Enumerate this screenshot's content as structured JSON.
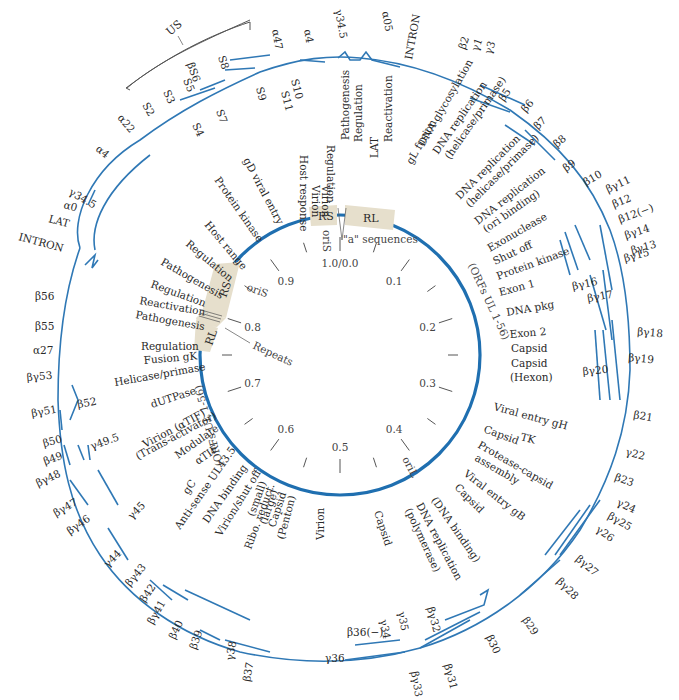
{
  "diagram": {
    "colors": {
      "gene_arrow": "#2f78b5",
      "inner_circle": "#1f6fb0",
      "repeat_box": "#e6dfcc",
      "text": "#2a2a2a",
      "leader": "#555555"
    },
    "center": {
      "x": 340,
      "y": 355
    },
    "inner_radius": 140,
    "regions": {
      "us_bracket_label": "US",
      "rs_top": "RS",
      "rl_top": "RL",
      "rs_left": "RS",
      "rl_left": "RL",
      "a_sequences": "\"a\" sequences",
      "repeats": "Repeats",
      "oris_top": "oriS",
      "oris_left": "oriS",
      "oril": "oriL",
      "orfs_right": "(ORFs UL 1-56)",
      "orfs_left": "(ORFs UL 1-56)"
    },
    "map_units": [
      {
        "label": "1.0/0.0",
        "angle": 0
      },
      {
        "label": "0.1",
        "angle": 36
      },
      {
        "label": "0.2",
        "angle": 72
      },
      {
        "label": "0.3",
        "angle": 108
      },
      {
        "label": "0.4",
        "angle": 144
      },
      {
        "label": "0.5",
        "angle": 180
      },
      {
        "label": "0.6",
        "angle": 216
      },
      {
        "label": "0.7",
        "angle": 252
      },
      {
        "label": "0.8",
        "angle": 288
      },
      {
        "label": "0.9",
        "angle": 324
      }
    ],
    "functions": [
      {
        "text": "Host response",
        "x": 300,
        "y": 155,
        "rot": 90
      },
      {
        "text": "Virion",
        "x": 312,
        "y": 185,
        "rot": 90
      },
      {
        "text": "Virion",
        "x": 322,
        "y": 185,
        "rot": 90
      },
      {
        "text": "Regulation",
        "x": 327,
        "y": 145,
        "rot": 90
      },
      {
        "text": "Pathogenesis",
        "x": 349,
        "y": 140,
        "rot": -90
      },
      {
        "text": "Regulation",
        "x": 362,
        "y": 142,
        "rot": -90
      },
      {
        "text": "LAT",
        "x": 378,
        "y": 158,
        "rot": -90
      },
      {
        "text": "Reactivation",
        "x": 392,
        "y": 142,
        "rot": -90
      },
      {
        "text": "gL fusion",
        "x": 412,
        "y": 165,
        "rot": -60
      },
      {
        "text": "DNA glycosylation",
        "x": 424,
        "y": 147,
        "rot": -60
      },
      {
        "text": "DNA replication",
        "x": 438,
        "y": 155,
        "rot": -55
      },
      {
        "text": "(helicase/primase)",
        "x": 450,
        "y": 160,
        "rot": -55
      },
      {
        "text": "DNA replication",
        "x": 460,
        "y": 200,
        "rot": -45
      },
      {
        "text": "(helicase/primase)",
        "x": 470,
        "y": 208,
        "rot": -45
      },
      {
        "text": "DNA replication",
        "x": 478,
        "y": 225,
        "rot": -38
      },
      {
        "text": "(ori binding)",
        "x": 486,
        "y": 233,
        "rot": -35
      },
      {
        "text": "Exonuclease",
        "x": 490,
        "y": 252,
        "rot": -30
      },
      {
        "text": "Shut off",
        "x": 495,
        "y": 265,
        "rot": -25
      },
      {
        "text": "Protein kinase",
        "x": 498,
        "y": 280,
        "rot": -20
      },
      {
        "text": "Exon 1",
        "x": 500,
        "y": 296,
        "rot": -15
      },
      {
        "text": "DNA pkg",
        "x": 507,
        "y": 316,
        "rot": -10
      },
      {
        "text": "Exon 2",
        "x": 510,
        "y": 338,
        "rot": -5
      },
      {
        "text": "Capsid",
        "x": 511,
        "y": 352,
        "rot": 0
      },
      {
        "text": "Capsid",
        "x": 511,
        "y": 367,
        "rot": 0
      },
      {
        "text": "(Hexon)",
        "x": 510,
        "y": 381,
        "rot": 0
      },
      {
        "text": "Viral entry gH",
        "x": 493,
        "y": 410,
        "rot": 15
      },
      {
        "text": "TK",
        "x": 520,
        "y": 440,
        "rot": 15
      },
      {
        "text": "Capsid",
        "x": 483,
        "y": 432,
        "rot": 20
      },
      {
        "text": "Protease-capsid",
        "x": 477,
        "y": 447,
        "rot": 30
      },
      {
        "text": "assembly",
        "x": 474,
        "y": 460,
        "rot": 30
      },
      {
        "text": "Viral entry gB",
        "x": 463,
        "y": 475,
        "rot": 38
      },
      {
        "text": "Capsid",
        "x": 454,
        "y": 488,
        "rot": 45
      },
      {
        "text": "(DNA binding)",
        "x": 431,
        "y": 500,
        "rot": 55
      },
      {
        "text": "DNA replication",
        "x": 416,
        "y": 505,
        "rot": 62
      },
      {
        "text": "(polymerase)",
        "x": 405,
        "y": 510,
        "rot": 65
      },
      {
        "text": "Capsid",
        "x": 374,
        "y": 512,
        "rot": 72
      },
      {
        "text": "Virion",
        "x": 324,
        "y": 540,
        "rot": -90
      },
      {
        "text": "(small)",
        "x": 254,
        "y": 517,
        "rot": -70
      },
      {
        "text": "Ribo. reduct.",
        "x": 251,
        "y": 550,
        "rot": -70
      },
      {
        "text": "(large)",
        "x": 266,
        "y": 525,
        "rot": -70
      },
      {
        "text": "Capsid",
        "x": 275,
        "y": 528,
        "rot": -72
      },
      {
        "text": "(Penton)",
        "x": 284,
        "y": 540,
        "rot": -75
      },
      {
        "text": "gC",
        "x": 188,
        "y": 495,
        "rot": -55
      },
      {
        "text": "Anti-sense UL43.5",
        "x": 180,
        "y": 530,
        "rot": -55
      },
      {
        "text": "DNA binding",
        "x": 208,
        "y": 524,
        "rot": -55
      },
      {
        "text": "Virion/shut off",
        "x": 221,
        "y": 537,
        "rot": -58
      },
      {
        "text": "Modulate",
        "x": 178,
        "y": 459,
        "rot": -35
      },
      {
        "text": "αTIF",
        "x": 198,
        "y": 465,
        "rot": -35
      },
      {
        "text": "Virion (αTIF)",
        "x": 145,
        "y": 448,
        "rot": -28
      },
      {
        "text": "(Trans-activator)",
        "x": 138,
        "y": 460,
        "rot": -28
      },
      {
        "text": "dUTPase",
        "x": 152,
        "y": 408,
        "rot": -18
      },
      {
        "text": "Helicase/primase",
        "x": 115,
        "y": 386,
        "rot": -10
      },
      {
        "text": "Fusion gK",
        "x": 144,
        "y": 364,
        "rot": -5
      },
      {
        "text": "Regulation",
        "x": 141,
        "y": 350,
        "rot": 0
      },
      {
        "text": "Pathogenesis",
        "x": 135,
        "y": 318,
        "rot": 10
      },
      {
        "text": "Reactivation",
        "x": 139,
        "y": 304,
        "rot": 10
      },
      {
        "text": "Regulation",
        "x": 150,
        "y": 287,
        "rot": 20
      },
      {
        "text": "Pathogenesis",
        "x": 160,
        "y": 264,
        "rot": 30
      },
      {
        "text": "Regulation",
        "x": 185,
        "y": 245,
        "rot": 40
      },
      {
        "text": "Host range",
        "x": 204,
        "y": 225,
        "rot": 50
      },
      {
        "text": "Protein kinase",
        "x": 214,
        "y": 180,
        "rot": 55
      },
      {
        "text": "gD viral entry",
        "x": 243,
        "y": 160,
        "rot": 62
      }
    ],
    "genes": [
      {
        "text": "α47",
        "x": 272,
        "y": 30,
        "rot": 80
      },
      {
        "text": "α4",
        "x": 304,
        "y": 30,
        "rot": 80
      },
      {
        "text": "γ34.5",
        "x": 335,
        "y": 10,
        "rot": 80
      },
      {
        "text": "α05",
        "x": 382,
        "y": 12,
        "rot": 80
      },
      {
        "text": "INTRON",
        "x": 412,
        "y": 60,
        "rot": -80
      },
      {
        "text": "β2",
        "x": 465,
        "y": 50,
        "rot": -70
      },
      {
        "text": "γ1",
        "x": 478,
        "y": 52,
        "rot": -70
      },
      {
        "text": "γ3",
        "x": 491,
        "y": 55,
        "rot": -70
      },
      {
        "text": "β5",
        "x": 504,
        "y": 102,
        "rot": -55
      },
      {
        "text": "β6",
        "x": 526,
        "y": 113,
        "rot": -50
      },
      {
        "text": "β7",
        "x": 538,
        "y": 130,
        "rot": -45
      },
      {
        "text": "β8",
        "x": 557,
        "y": 148,
        "rot": -40
      },
      {
        "text": "β9",
        "x": 566,
        "y": 172,
        "rot": -35
      },
      {
        "text": "β10",
        "x": 586,
        "y": 186,
        "rot": -30
      },
      {
        "text": "βγ11",
        "x": 608,
        "y": 193,
        "rot": -25
      },
      {
        "text": "β12",
        "x": 614,
        "y": 208,
        "rot": -22
      },
      {
        "text": "β12(−)",
        "x": 620,
        "y": 223,
        "rot": -20
      },
      {
        "text": "βγ14",
        "x": 626,
        "y": 239,
        "rot": -18
      },
      {
        "text": "βγ13",
        "x": 632,
        "y": 254,
        "rot": -15
      },
      {
        "text": "βγ15",
        "x": 625,
        "y": 262,
        "rot": -15
      },
      {
        "text": "βγ16",
        "x": 573,
        "y": 290,
        "rot": -12
      },
      {
        "text": "βγ17",
        "x": 588,
        "y": 302,
        "rot": -10
      },
      {
        "text": "βγ18",
        "x": 637,
        "y": 335,
        "rot": 5
      },
      {
        "text": "βγ19",
        "x": 628,
        "y": 361,
        "rot": 5
      },
      {
        "text": "βγ20",
        "x": 583,
        "y": 375,
        "rot": -5
      },
      {
        "text": "β21",
        "x": 633,
        "y": 418,
        "rot": 10
      },
      {
        "text": "γ22",
        "x": 625,
        "y": 455,
        "rot": 15
      },
      {
        "text": "β23",
        "x": 614,
        "y": 480,
        "rot": 20
      },
      {
        "text": "γ24",
        "x": 616,
        "y": 505,
        "rot": 25
      },
      {
        "text": "βγ25",
        "x": 607,
        "y": 518,
        "rot": 30
      },
      {
        "text": "γ26",
        "x": 595,
        "y": 531,
        "rot": 35
      },
      {
        "text": "βγ27",
        "x": 575,
        "y": 560,
        "rot": 40
      },
      {
        "text": "βγ28",
        "x": 556,
        "y": 582,
        "rot": 45
      },
      {
        "text": "β29",
        "x": 522,
        "y": 620,
        "rot": 55
      },
      {
        "text": "β30",
        "x": 486,
        "y": 637,
        "rot": 65
      },
      {
        "text": "βγ31",
        "x": 444,
        "y": 665,
        "rot": 75
      },
      {
        "text": "βγ32",
        "x": 427,
        "y": 608,
        "rot": 75
      },
      {
        "text": "βγ33",
        "x": 411,
        "y": 672,
        "rot": 80
      },
      {
        "text": "γ35",
        "x": 398,
        "y": 612,
        "rot": 80
      },
      {
        "text": "γ34",
        "x": 380,
        "y": 620,
        "rot": 80
      },
      {
        "text": "β36(−)",
        "x": 347,
        "y": 636,
        "rot": 0
      },
      {
        "text": "γ36",
        "x": 325,
        "y": 662,
        "rot": 0
      },
      {
        "text": "β37",
        "x": 250,
        "y": 682,
        "rot": -80
      },
      {
        "text": "γ38",
        "x": 233,
        "y": 661,
        "rot": -80
      },
      {
        "text": "β39",
        "x": 196,
        "y": 650,
        "rot": -70
      },
      {
        "text": "β40",
        "x": 175,
        "y": 640,
        "rot": -65
      },
      {
        "text": "βγ41",
        "x": 153,
        "y": 625,
        "rot": -60
      },
      {
        "text": "β42",
        "x": 145,
        "y": 603,
        "rot": -55
      },
      {
        "text": "βγ43",
        "x": 130,
        "y": 587,
        "rot": -50
      },
      {
        "text": "γ44",
        "x": 108,
        "y": 568,
        "rot": -45
      },
      {
        "text": "γ45",
        "x": 132,
        "y": 520,
        "rot": -45
      },
      {
        "text": "βγ46",
        "x": 70,
        "y": 535,
        "rot": -35
      },
      {
        "text": "βγ47",
        "x": 56,
        "y": 517,
        "rot": -30
      },
      {
        "text": "βγ48",
        "x": 38,
        "y": 487,
        "rot": -25
      },
      {
        "text": "β49",
        "x": 45,
        "y": 465,
        "rot": -20
      },
      {
        "text": "γ49.5",
        "x": 92,
        "y": 450,
        "rot": -20
      },
      {
        "text": "β50",
        "x": 44,
        "y": 447,
        "rot": -15
      },
      {
        "text": "βγ51",
        "x": 32,
        "y": 417,
        "rot": -10
      },
      {
        "text": "β52",
        "x": 78,
        "y": 408,
        "rot": -10
      },
      {
        "text": "βγ53",
        "x": 27,
        "y": 381,
        "rot": -5
      },
      {
        "text": "α27",
        "x": 33,
        "y": 354,
        "rot": 0
      },
      {
        "text": "β55",
        "x": 35,
        "y": 330,
        "rot": 0
      },
      {
        "text": "β56",
        "x": 35,
        "y": 300,
        "rot": 0
      },
      {
        "text": "INTRON",
        "x": 18,
        "y": 240,
        "rot": 15
      },
      {
        "text": "LAT",
        "x": 48,
        "y": 222,
        "rot": 15
      },
      {
        "text": "α0",
        "x": 63,
        "y": 208,
        "rot": 15
      },
      {
        "text": "γ34.5",
        "x": 68,
        "y": 194,
        "rot": 30
      },
      {
        "text": "α4",
        "x": 95,
        "y": 150,
        "rot": 40
      },
      {
        "text": "α22",
        "x": 117,
        "y": 118,
        "rot": 50
      },
      {
        "text": "S2",
        "x": 142,
        "y": 105,
        "rot": 60
      },
      {
        "text": "S3",
        "x": 163,
        "y": 92,
        "rot": 65
      },
      {
        "text": "S4",
        "x": 192,
        "y": 125,
        "rot": 65
      },
      {
        "text": "S5",
        "x": 183,
        "y": 80,
        "rot": 68
      },
      {
        "text": "βS6",
        "x": 187,
        "y": 64,
        "rot": 70
      },
      {
        "text": "S7",
        "x": 216,
        "y": 111,
        "rot": 70
      },
      {
        "text": "S8",
        "x": 218,
        "y": 57,
        "rot": 72
      },
      {
        "text": "S9",
        "x": 256,
        "y": 88,
        "rot": 75
      },
      {
        "text": "S10",
        "x": 291,
        "y": 80,
        "rot": 75
      },
      {
        "text": "S11",
        "x": 281,
        "y": 92,
        "rot": 75
      }
    ]
  }
}
